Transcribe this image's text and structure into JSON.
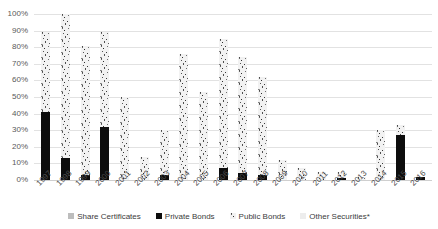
{
  "chart_data": {
    "type": "bar",
    "subtype": "stacked",
    "title": "",
    "xlabel": "",
    "ylabel": "",
    "ylim": [
      0,
      100
    ],
    "y_tick_labels": [
      "100%",
      "90%",
      "80%",
      "70%",
      "60%",
      "50%",
      "40%",
      "30%",
      "20%",
      "10%",
      "0%"
    ],
    "y_tick_values": [
      100,
      90,
      80,
      70,
      60,
      50,
      40,
      30,
      20,
      10,
      0
    ],
    "grid": true,
    "legend_position": "bottom",
    "categories": [
      "1997",
      "1998",
      "1999",
      "2000",
      "2001",
      "2002",
      "2003",
      "2004",
      "2005",
      "2006",
      "2007",
      "2008",
      "2009",
      "2010",
      "2011",
      "2012",
      "2013",
      "2014",
      "2015",
      "2016"
    ],
    "series": [
      {
        "name": "Private Bonds",
        "color": "#0d0d0d",
        "pattern": "solid",
        "values": [
          41,
          13,
          3,
          32,
          0,
          0,
          3,
          0,
          0,
          7,
          4,
          3,
          0,
          0,
          0,
          1,
          0,
          0,
          27,
          2
        ]
      },
      {
        "name": "Public Bonds",
        "color": "#f2f2f2",
        "pattern": "speckled",
        "values": [
          48,
          87,
          78,
          57,
          50,
          14,
          27,
          76,
          53,
          78,
          70,
          59,
          12,
          7,
          5,
          4,
          2,
          30,
          6,
          0
        ]
      },
      {
        "name": "Share Certificates",
        "color": "#bdbdbd",
        "pattern": "solid",
        "values": [
          0,
          0,
          0,
          0,
          0,
          0,
          0,
          0,
          0,
          0,
          0,
          0,
          0,
          0,
          0,
          0,
          0,
          0,
          0,
          0
        ]
      },
      {
        "name": "Other Securities*",
        "color": "#ededed",
        "pattern": "solid",
        "values": [
          0,
          0,
          0,
          0,
          0,
          0,
          0,
          0,
          0,
          0,
          0,
          0,
          0,
          0,
          0,
          0,
          0,
          0,
          0,
          0
        ]
      }
    ],
    "totals": [
      89,
      100,
      81,
      89,
      50,
      14,
      30,
      76,
      53,
      85,
      74,
      62,
      12,
      7,
      5,
      5,
      2,
      30,
      33,
      2
    ]
  },
  "legend": {
    "items": [
      {
        "label": "Share Certificates",
        "swatch": "share-swatch"
      },
      {
        "label": "Private Bonds",
        "swatch": "private-swatch"
      },
      {
        "label": "Public Bonds",
        "swatch": "public-swatch"
      },
      {
        "label": "Other Securities*",
        "swatch": "other-swatch"
      }
    ]
  }
}
